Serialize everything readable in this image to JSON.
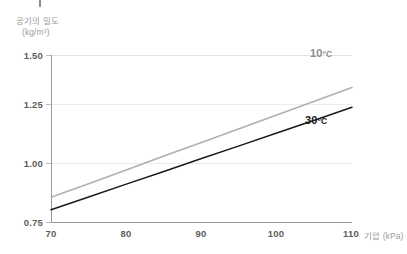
{
  "chart_data": {
    "type": "line",
    "title": "",
    "xlabel": "기압 (kPa)",
    "ylabel": "공기의 밀도",
    "ylabel_units": "(kg/m³)",
    "xlim": [
      70,
      110
    ],
    "ylim": [
      0.75,
      1.5
    ],
    "xticks": [
      "70",
      "80",
      "90",
      "100",
      "110"
    ],
    "xtick_values": [
      70,
      80,
      90,
      100,
      110
    ],
    "yticks": [
      "0.75",
      "1.00",
      "1.25",
      "1.50"
    ],
    "ytick_values": [
      0.75,
      1.0,
      1.25,
      1.5
    ],
    "grid": "horizontal-light",
    "legend": "inline-annotations",
    "series": [
      {
        "name": "10°C",
        "label": "10",
        "degree": "°C",
        "color": "#b0b0b0",
        "x": [
          70,
          75,
          80,
          85,
          90,
          95,
          100,
          105,
          110
        ],
        "values": [
          0.861,
          0.922,
          0.984,
          1.046,
          1.107,
          1.169,
          1.23,
          1.292,
          1.354
        ]
      },
      {
        "name": "30°C",
        "label": "30",
        "degree": "°C",
        "color": "#1a1a1a",
        "x": [
          70,
          75,
          80,
          85,
          90,
          95,
          100,
          105,
          110
        ],
        "values": [
          0.805,
          0.862,
          0.92,
          0.977,
          1.035,
          1.092,
          1.15,
          1.207,
          1.265
        ]
      }
    ]
  },
  "colors": {
    "axis": "#9a9a9a",
    "grid": "#ededed",
    "tick_text": "#5d5d5d",
    "label_text": "#9b9b9b",
    "series_cold": "#b0b0b0",
    "series_warm": "#1a1a1a",
    "background": "#ffffff"
  }
}
